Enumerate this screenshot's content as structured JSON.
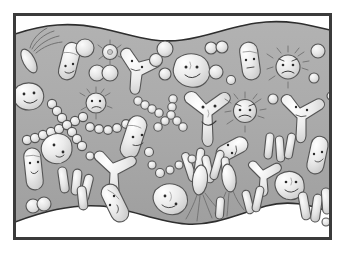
{
  "artwork": {
    "title": "Microbes in a layer of mucus",
    "style": "cartoon line illustration, grayscale",
    "caption": "",
    "frame": {
      "border_color": "#3a3a3a",
      "border_width_px": 3,
      "outer_margin_px": 12,
      "inner_background": "#ffffff"
    },
    "background": {
      "band_color": "#a9a9a9",
      "band_highlight": "#b8b8b8",
      "band_shadow": "#9a9a9a",
      "wave_color": "#ffffff",
      "wave_outline": "#2f2f2f",
      "description": "gray mucus band with wavy white margins top and bottom"
    },
    "palette": {
      "cell_fill_light": "#f2f2f2",
      "cell_fill_mid": "#dcdcdc",
      "cell_fill_shade": "#c4c4c4",
      "outline": "#4a4a4a",
      "face_ink": "#2b2b2b"
    },
    "organism_types": [
      {
        "key": "rod",
        "label": "Rod-shaped bacterium (bacillus)",
        "count": 16
      },
      {
        "key": "coccus",
        "label": "Round bacterium (coccus)",
        "count": 22
      },
      {
        "key": "chain",
        "label": "Chain of cocci (streptococcus)",
        "count": 5
      },
      {
        "key": "y-shape",
        "label": "Y-shaped / branched microbe",
        "count": 8
      },
      {
        "key": "spiky",
        "label": "Spiky virus particle",
        "count": 5
      },
      {
        "key": "flagellate",
        "label": "Flagellated microbe",
        "count": 4
      },
      {
        "key": "blob-face",
        "label": "Amoeboid blob with face",
        "count": 9
      }
    ],
    "face_expressions": [
      "smiling",
      "neutral",
      "grumpy",
      "surprised",
      "sleepy",
      "angry"
    ],
    "organisms": [
      {
        "id": 1,
        "type": "flagellate",
        "x": 35,
        "y": 52,
        "face": false,
        "note": "flagellated rod, upper left, long hair-like tails"
      },
      {
        "id": 2,
        "type": "rod",
        "x": 71,
        "y": 62,
        "face": true,
        "expression": "neutral"
      },
      {
        "id": 3,
        "type": "coccus",
        "x": 85,
        "y": 48,
        "face": false
      },
      {
        "id": 4,
        "type": "blob-face",
        "x": 31,
        "y": 96,
        "face": true,
        "expression": "smiling"
      },
      {
        "id": 5,
        "type": "coccus",
        "x": 98,
        "y": 73,
        "face": false
      },
      {
        "id": 6,
        "type": "coccus",
        "x": 109,
        "y": 73,
        "face": false
      },
      {
        "id": 7,
        "type": "spiky",
        "x": 110,
        "y": 52,
        "face": false
      },
      {
        "id": 8,
        "type": "spiky",
        "x": 96,
        "y": 104,
        "face": true,
        "expression": "grumpy"
      },
      {
        "id": 9,
        "type": "y-shape",
        "x": 136,
        "y": 73,
        "face": true,
        "expression": "neutral"
      },
      {
        "id": 10,
        "type": "coccus",
        "x": 155,
        "y": 60,
        "face": false
      },
      {
        "id": 11,
        "type": "coccus",
        "x": 164,
        "y": 74,
        "face": false
      },
      {
        "id": 12,
        "type": "coccus",
        "x": 165,
        "y": 50,
        "face": false
      },
      {
        "id": 13,
        "type": "blob-face",
        "x": 193,
        "y": 71,
        "face": true,
        "expression": "smiling"
      },
      {
        "id": 14,
        "type": "coccus",
        "x": 215,
        "y": 72,
        "face": false
      },
      {
        "id": 15,
        "type": "coccus",
        "x": 212,
        "y": 48,
        "face": false
      },
      {
        "id": 16,
        "type": "coccus",
        "x": 222,
        "y": 48,
        "face": false
      },
      {
        "id": 17,
        "type": "coccus",
        "x": 230,
        "y": 80,
        "face": false
      },
      {
        "id": 18,
        "type": "rod",
        "x": 250,
        "y": 60,
        "face": true,
        "expression": "neutral"
      },
      {
        "id": 19,
        "type": "spiky",
        "x": 288,
        "y": 66,
        "face": true,
        "expression": "grumpy"
      },
      {
        "id": 20,
        "type": "coccus",
        "x": 317,
        "y": 52,
        "face": false
      },
      {
        "id": 21,
        "type": "coccus",
        "x": 313,
        "y": 78,
        "face": false
      },
      {
        "id": 22,
        "type": "chain",
        "x": 55,
        "y": 117,
        "face": false,
        "note": "X crossing chains of cocci"
      },
      {
        "id": 23,
        "type": "chain",
        "x": 100,
        "y": 128,
        "face": false
      },
      {
        "id": 24,
        "type": "chain",
        "x": 152,
        "y": 110,
        "face": false
      },
      {
        "id": 25,
        "type": "chain",
        "x": 172,
        "y": 125,
        "face": false
      },
      {
        "id": 26,
        "type": "rod",
        "x": 138,
        "y": 137,
        "face": true,
        "expression": "neutral"
      },
      {
        "id": 27,
        "type": "y-shape",
        "x": 205,
        "y": 118,
        "face": true,
        "expression": "smiling"
      },
      {
        "id": 28,
        "type": "spiky",
        "x": 245,
        "y": 110,
        "face": true,
        "expression": "angry"
      },
      {
        "id": 29,
        "type": "coccus",
        "x": 273,
        "y": 99,
        "face": false
      },
      {
        "id": 30,
        "type": "y-shape",
        "x": 297,
        "y": 115,
        "face": true,
        "expression": "neutral"
      },
      {
        "id": 31,
        "type": "blob-face",
        "x": 60,
        "y": 150,
        "face": true,
        "expression": "surprised"
      },
      {
        "id": 32,
        "type": "rod",
        "x": 33,
        "y": 168,
        "face": true,
        "expression": "neutral"
      },
      {
        "id": 33,
        "type": "y-shape",
        "x": 115,
        "y": 172,
        "face": false
      },
      {
        "id": 34,
        "type": "rod",
        "x": 237,
        "y": 146,
        "face": true,
        "expression": "neutral"
      },
      {
        "id": 35,
        "type": "rod",
        "x": 272,
        "y": 148,
        "face": false
      },
      {
        "id": 36,
        "type": "rod",
        "x": 282,
        "y": 152,
        "face": false
      },
      {
        "id": 37,
        "type": "rod",
        "x": 318,
        "y": 155,
        "face": true,
        "expression": "neutral"
      },
      {
        "id": 38,
        "type": "rod",
        "x": 66,
        "y": 180,
        "face": false
      },
      {
        "id": 39,
        "type": "rod",
        "x": 76,
        "y": 182,
        "face": false
      },
      {
        "id": 40,
        "type": "rod",
        "x": 84,
        "y": 188,
        "face": false
      },
      {
        "id": 41,
        "type": "coccus",
        "x": 34,
        "y": 206,
        "face": false
      },
      {
        "id": 42,
        "type": "coccus",
        "x": 44,
        "y": 205,
        "face": false
      },
      {
        "id": 43,
        "type": "rod",
        "x": 118,
        "y": 201,
        "face": true,
        "expression": "sleepy"
      },
      {
        "id": 44,
        "type": "blob-face",
        "x": 171,
        "y": 200,
        "face": true,
        "expression": "smiling"
      },
      {
        "id": 45,
        "type": "flagellate",
        "x": 201,
        "y": 185,
        "face": false
      },
      {
        "id": 46,
        "type": "flagellate",
        "x": 229,
        "y": 182,
        "face": false
      },
      {
        "id": 47,
        "type": "y-shape",
        "x": 262,
        "y": 178,
        "face": false
      },
      {
        "id": 48,
        "type": "blob-face",
        "x": 290,
        "y": 186,
        "face": true,
        "expression": "smiling"
      },
      {
        "id": 49,
        "type": "rod",
        "x": 306,
        "y": 205,
        "face": false
      },
      {
        "id": 50,
        "type": "rod",
        "x": 316,
        "y": 207,
        "face": false
      }
    ]
  }
}
